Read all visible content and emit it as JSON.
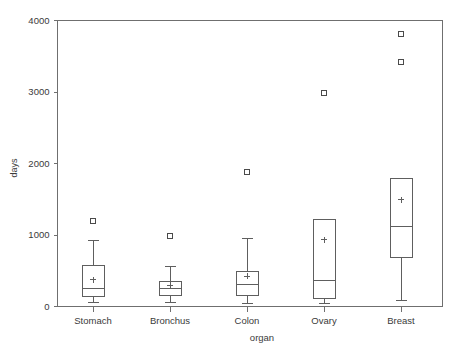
{
  "chart_data": {
    "type": "box",
    "title": "",
    "xlabel": "organ",
    "ylabel": "days",
    "categories": [
      "Stomach",
      "Bronchus",
      "Colon",
      "Ovary",
      "Breast"
    ],
    "ylim": [
      0,
      4000
    ],
    "yticks": [
      0,
      1000,
      2000,
      3000,
      4000
    ],
    "ytick_labels": [
      "0",
      "1000",
      "2000",
      "3000",
      "4000"
    ],
    "grid": false,
    "legend": null,
    "mean_marker": "+",
    "outlier_marker": "square",
    "boxes": [
      {
        "category": "Stomach",
        "whisker_low": 55,
        "q1": 140,
        "median": 250,
        "q3": 575,
        "whisker_high": 920,
        "mean": 375,
        "outliers": [
          1190
        ]
      },
      {
        "category": "Bronchus",
        "whisker_low": 55,
        "q1": 155,
        "median": 250,
        "q3": 350,
        "whisker_high": 560,
        "mean": 295,
        "outliers": [
          980
        ]
      },
      {
        "category": "Colon",
        "whisker_low": 40,
        "q1": 155,
        "median": 305,
        "q3": 490,
        "whisker_high": 950,
        "mean": 420,
        "outliers": [
          1875
        ]
      },
      {
        "category": "Ovary",
        "whisker_low": 40,
        "q1": 110,
        "median": 365,
        "q3": 1215,
        "whisker_high": 1215,
        "mean": 935,
        "outliers": [
          2980
        ]
      },
      {
        "category": "Breast",
        "whisker_low": 85,
        "q1": 685,
        "median": 1120,
        "q3": 1790,
        "whisker_high": 1790,
        "mean": 1495,
        "outliers": [
          3815,
          3425
        ]
      }
    ]
  },
  "colors": {
    "frame": "#6f6f6f",
    "ink": "#5e5e5e",
    "text": "#3a3a3a",
    "background": "#ffffff"
  }
}
